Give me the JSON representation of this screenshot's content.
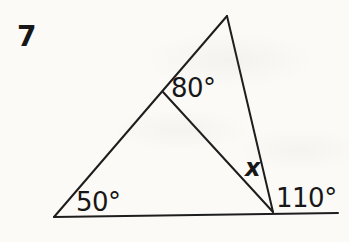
{
  "problem_number": "7",
  "diagram": {
    "type": "triangle-with-cevian-and-exterior-angle",
    "line_color": "#1d1d1d",
    "line_width": 2,
    "background": "#fbfaf7",
    "vertices": {
      "apex": [
        227,
        16
      ],
      "bottom_left": [
        54,
        217
      ],
      "bottom_right": [
        273,
        212
      ],
      "cevian_junction": [
        163,
        92
      ],
      "base_right_end": [
        338,
        213
      ]
    },
    "lines": [
      {
        "name": "triangle-left-side",
        "from": [
          54,
          217
        ],
        "to": [
          227,
          16
        ]
      },
      {
        "name": "triangle-right-side",
        "from": [
          227,
          16
        ],
        "to": [
          273,
          212
        ]
      },
      {
        "name": "base-line-extended",
        "from": [
          54,
          217
        ],
        "to": [
          338,
          213
        ]
      },
      {
        "name": "cevian-line",
        "from": [
          163,
          92
        ],
        "to": [
          273,
          212
        ]
      }
    ],
    "labels": {
      "angle_at_junction": "80°",
      "angle_bottom_left": "50°",
      "angle_unknown": "x",
      "angle_exterior_right": "110°"
    }
  }
}
